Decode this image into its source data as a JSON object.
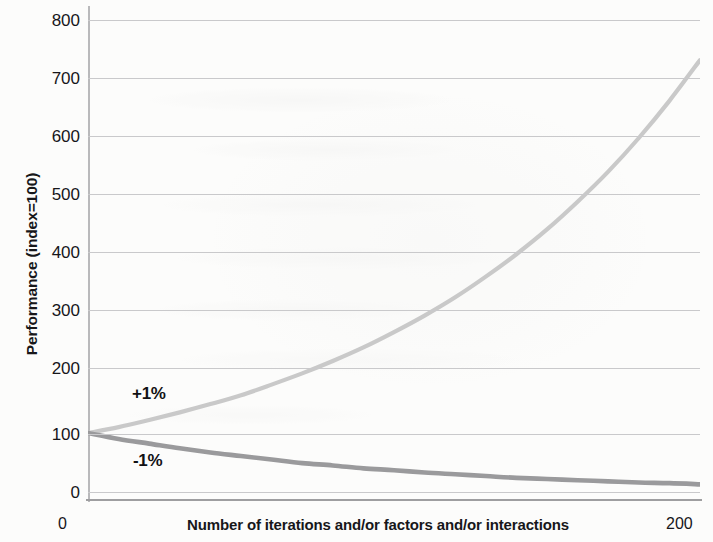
{
  "chart_data": {
    "type": "line",
    "title": "",
    "subtitle": "",
    "xlabel": "Number of iterations and/or factors and/or interactions",
    "ylabel": "Performance (index=100)",
    "xlim": [
      0,
      200
    ],
    "ylim": [
      0,
      800
    ],
    "xticks": [
      "0",
      "200"
    ],
    "yticks": [
      "0",
      "100",
      "200",
      "300",
      "400",
      "500",
      "600",
      "700",
      "800"
    ],
    "ytick_values": [
      0,
      100,
      200,
      300,
      400,
      500,
      600,
      700,
      800
    ],
    "grid": "horizontal",
    "legend_position": "inline-annotations",
    "annotations": [
      {
        "text": "+1%",
        "series": "plus-one-percent",
        "x": 12,
        "y": 155
      },
      {
        "text": "-1%",
        "series": "minus-one-percent",
        "x": 12,
        "y": 52
      }
    ],
    "series": [
      {
        "name": "+1%",
        "label": "+1%",
        "color": "#c9c9c9",
        "formula": "100 * 1.01^x",
        "x": [
          0,
          10,
          20,
          30,
          40,
          50,
          60,
          70,
          80,
          90,
          100,
          110,
          120,
          130,
          140,
          150,
          160,
          170,
          180,
          190,
          200
        ],
        "values": [
          100,
          110,
          122,
          135,
          149,
          164,
          182,
          201,
          222,
          245,
          271,
          299,
          330,
          365,
          403,
          445,
          492,
          543,
          600,
          663,
          732
        ]
      },
      {
        "name": "-1%",
        "label": "-1%",
        "color": "#9a9a9c",
        "formula": "100 * 0.99^x",
        "x": [
          0,
          10,
          20,
          30,
          40,
          50,
          60,
          70,
          80,
          90,
          100,
          110,
          120,
          130,
          140,
          150,
          160,
          170,
          180,
          190,
          200
        ],
        "values": [
          100,
          90,
          82,
          74,
          67,
          61,
          55,
          49,
          45,
          40,
          37,
          33,
          30,
          27,
          24,
          22,
          20,
          18,
          16,
          15,
          13
        ]
      }
    ]
  },
  "colors": {
    "positive_series": "#c9c9c9",
    "negative_series": "#9a9a9c",
    "gridline": "#c9c9cb",
    "axis": "#9e9ea0",
    "text": "#16161a"
  }
}
